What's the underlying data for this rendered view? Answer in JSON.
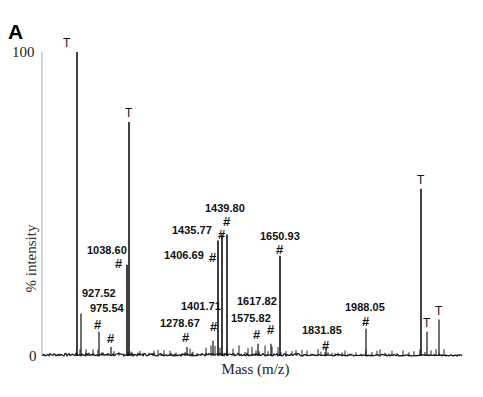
{
  "figure": {
    "panel_letter": "A",
    "y_tick_top": "100",
    "y_tick_bottom": "0",
    "ylabel": "% intensity",
    "xlabel": "Mass (m/z)"
  },
  "chart_data": {
    "type": "bar",
    "subtype": "mass-spectrum-stick",
    "title": "",
    "panel": "A",
    "xlabel": "Mass (m/z)",
    "ylabel": "% intensity",
    "ylim": [
      0,
      100
    ],
    "y_ticks": [
      "0",
      "100"
    ],
    "grid": false,
    "legend": "none",
    "annotation_key": {
      "T": "trypsin autolysis peak",
      "#": "matched peptide peak"
    },
    "peaks": [
      {
        "x_px": 77,
        "intensity": 100,
        "marker": "T",
        "label": ""
      },
      {
        "x_px": 81,
        "intensity": 14,
        "marker": "",
        "label": ""
      },
      {
        "x_px": 99,
        "intensity": 8,
        "marker": "#",
        "label": "927.52"
      },
      {
        "x_px": 111,
        "intensity": 3,
        "marker": "#",
        "label": "975.54"
      },
      {
        "x_px": 127,
        "intensity": 30,
        "marker": "#",
        "label": "1038.60"
      },
      {
        "x_px": 129,
        "intensity": 77,
        "marker": "T",
        "label": ""
      },
      {
        "x_px": 187,
        "intensity": 3,
        "marker": "#",
        "label": "1278.67"
      },
      {
        "x_px": 213,
        "intensity": 5,
        "marker": "#",
        "label": "1401.71"
      },
      {
        "x_px": 218,
        "intensity": 38,
        "marker": "#",
        "label": "1406.69"
      },
      {
        "x_px": 222,
        "intensity": 40,
        "marker": "#",
        "label": "1435.77"
      },
      {
        "x_px": 227,
        "intensity": 40,
        "marker": "#",
        "label": "1439.80"
      },
      {
        "x_px": 258,
        "intensity": 4,
        "marker": "#",
        "label": "1575.82"
      },
      {
        "x_px": 271,
        "intensity": 4,
        "marker": "#",
        "label": "1617.82"
      },
      {
        "x_px": 280,
        "intensity": 33,
        "marker": "#",
        "label": "1650.93"
      },
      {
        "x_px": 326,
        "intensity": 3,
        "marker": "#",
        "label": "1831.85"
      },
      {
        "x_px": 366,
        "intensity": 9,
        "marker": "#",
        "label": "1988.05"
      },
      {
        "x_px": 421,
        "intensity": 55,
        "marker": "T",
        "label": ""
      },
      {
        "x_px": 427,
        "intensity": 8,
        "marker": "T",
        "label": ""
      },
      {
        "x_px": 439,
        "intensity": 12,
        "marker": "T",
        "label": ""
      }
    ],
    "labeled_masses": [
      "927.52",
      "975.54",
      "1038.60",
      "1278.67",
      "1401.71",
      "1406.69",
      "1435.77",
      "1439.80",
      "1575.82",
      "1617.82",
      "1650.93",
      "1831.85",
      "1988.05"
    ]
  }
}
